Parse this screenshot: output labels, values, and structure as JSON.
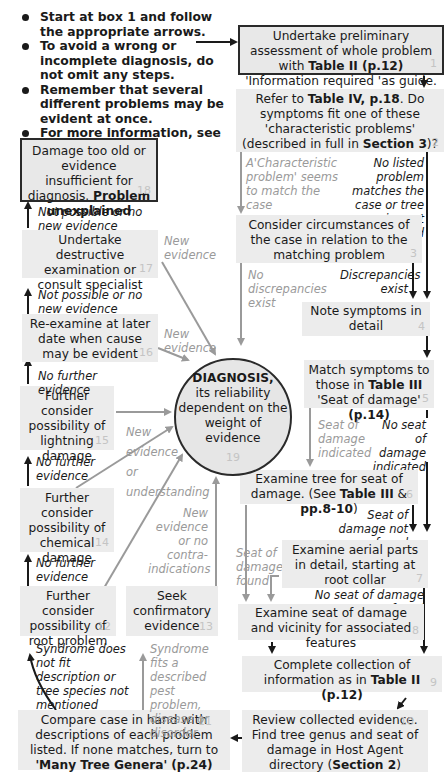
{
  "notes": [
    "Start at box 1 and follow the appropriate arrows.",
    "To avoid a wrong or incomplete diagnosis, do not omit any steps.",
    "Remember that several different problems may be evident at once.",
    "For more information, see p.16"
  ],
  "boxes": {
    "b1": {
      "pre": "Undertake preliminary assessment of whole problem with ",
      "bold": "Table II (p.12)",
      "post": " 'Information required 'as guide.",
      "num": "1"
    },
    "b2": {
      "pre": "Refer to ",
      "bold": "Table IV, p.18",
      "mid": ". Do symptoms fit one of these 'characteristic problems' (described in full in ",
      "bold2": "Section 3",
      "post": ")?",
      "num": "2"
    },
    "b3": {
      "text": "Consider circumstances of the case in relation to the matching problem",
      "num": "3"
    },
    "b4": {
      "text": "Note symptoms in detail",
      "num": "4"
    },
    "b5": {
      "pre": "Match symptoms to those in ",
      "bold": "Table III",
      "mid": " 'Seat of damage' ",
      "bold2": "(p.14)",
      "num": "5"
    },
    "b6": {
      "pre": "Examine tree for seat of damage. (See ",
      "bold": "Table III",
      "mid": " & ",
      "bold2": "pp.8-10",
      "post": ")",
      "num": "6"
    },
    "b7": {
      "text": "Examine aerial parts in detail, starting at root collar",
      "num": "7"
    },
    "b8": {
      "text": "Examine seat of damage and vicinity for associated features",
      "num": "8"
    },
    "b9": {
      "pre": "Complete collection of information as in ",
      "bold": "Table II (p.12)",
      "num": "9"
    },
    "b10": {
      "pre": "Review collected evidence. Find tree genus and seat of damage in Host Agent directory (",
      "bold": "Section 2",
      "post": ")",
      "num": "10"
    },
    "b11": {
      "pre": "Compare case in hand with descriptions of each problem listed. If none matches, turn to ",
      "bold": "'Many Tree Genera'",
      "mid": " ",
      "bold2": "(p.24)",
      "post": " and repeat process.",
      "num": "11"
    },
    "b12": {
      "text": "Further consider possibility of root problem",
      "num": "12"
    },
    "b13": {
      "text": "Seek confirmatory evidence",
      "num": "13"
    },
    "b14": {
      "text": "Further consider possibility of chemical damage",
      "num": "14"
    },
    "b15": {
      "text": "Further consider possibility of lightning damage",
      "num": "15"
    },
    "b16": {
      "text": "Re-examine at later date when cause may be evident",
      "num": "16"
    },
    "b17": {
      "text": "Undertake destructive examination or consult specialist",
      "num": "17"
    },
    "b18": {
      "pre": "Damage too old or evidence insufficient for diagnosis. ",
      "bold": "Problem unexplained",
      "num": "18"
    },
    "b19": {
      "bold": "DIAGNOSIS,",
      "text": "its reliability dependent on the weight of evidence",
      "num": "19"
    }
  },
  "labels": {
    "characteristic_match": "A'Characteristic problem' seems to match the case",
    "no_listed_problem": "No listed problem matches the case or tree species not mentioned",
    "no_discrepancies": "No discrepancies exist",
    "discrepancies_exist": "Discrepancies exist",
    "seat_indicated": "Seat of damage indicated",
    "no_seat_indicated": "No seat of damage indicated",
    "seat_not_found": "Seat of damage not found",
    "seat_found": "Seat of damage found",
    "no_seat_found": "No seat of damage found",
    "syndrome_not_fit": "Syndrome does not fit description or tree species not mentioned",
    "syndrome_fits": "Syndrome fits a described pest problem, disease or disorder",
    "new_evidence_no_contra": "New evidence or no contra-indications",
    "new_evidence_understanding_1": "New",
    "new_evidence_understanding_2": "evidence",
    "new_evidence_understanding_3": "or",
    "new_evidence_understanding_4": "understanding",
    "no_further_14": "No further evidence",
    "no_further_15": "No further evidence",
    "no_further_16": "No further evidence",
    "not_possible_17": "Not possible or  no new evidence",
    "not_possible_18": "Not possible or no new evidence",
    "new_evidence_16": "New evidence",
    "new_evidence_17": "New evidence"
  },
  "colors": {
    "box_fill": "#ececec",
    "frame": "#2a2a2a",
    "dark_arrow": "#1a1a1a",
    "grey_arrow": "#9a9a9a",
    "box_number": "#c4c4c4"
  }
}
